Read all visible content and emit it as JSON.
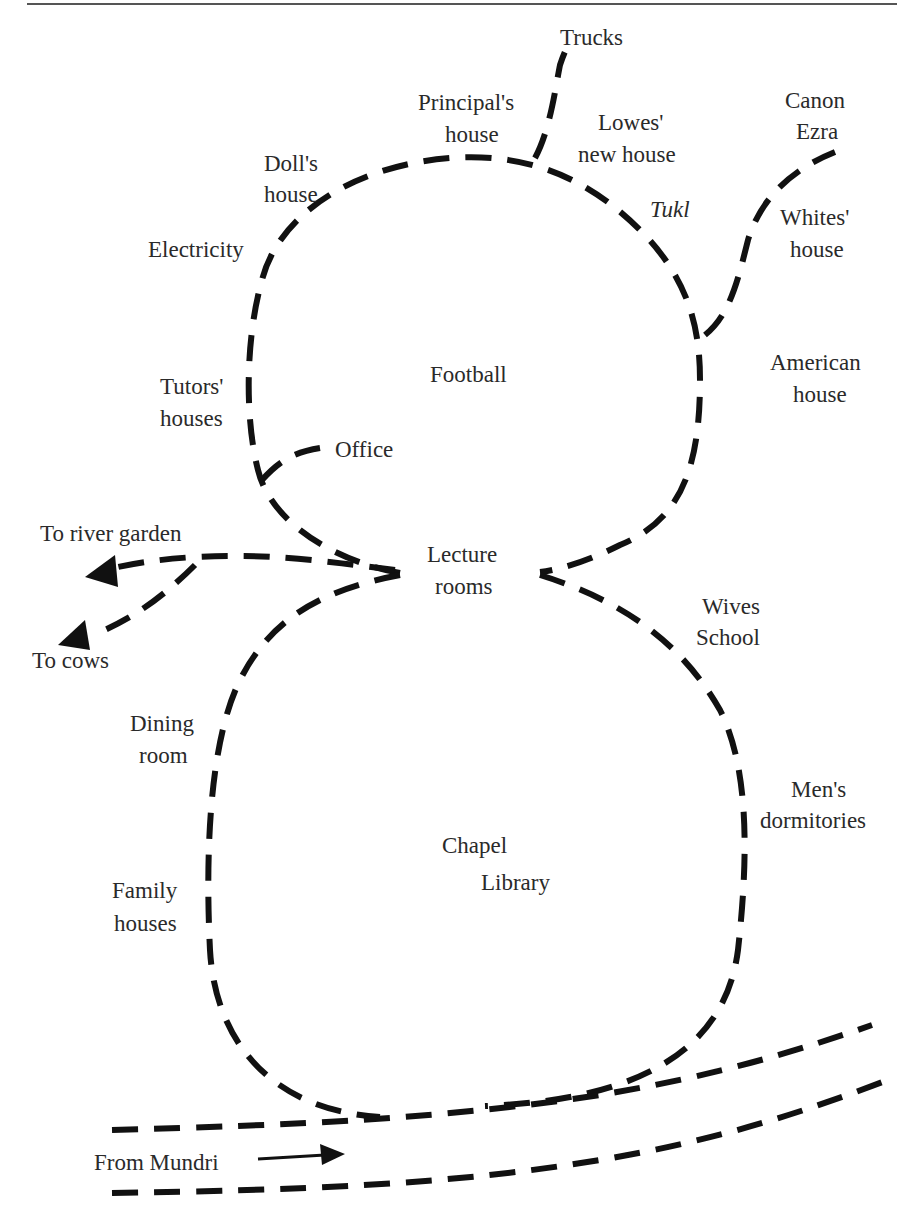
{
  "diagram": {
    "labels": {
      "trucks": "Trucks",
      "principals_house_1": "Principal's",
      "principals_house_2": "house",
      "lowes_1": "Lowes'",
      "lowes_2": "new house",
      "canon_1": "Canon",
      "canon_2": "Ezra",
      "dolls_1": "Doll's",
      "dolls_2": "house",
      "tukl": "Tukl",
      "whites_1": "Whites'",
      "whites_2": "house",
      "electricity": "Electricity",
      "football": "Football",
      "american_1": "American",
      "american_2": "house",
      "tutors_1": "Tutors'",
      "tutors_2": "houses",
      "office": "Office",
      "river_garden": "To river garden",
      "lecture_1": "Lecture",
      "lecture_2": "rooms",
      "wives_1": "Wives",
      "wives_2": "School",
      "cows": "To cows",
      "dining_1": "Dining",
      "dining_2": "room",
      "mens_1": "Men's",
      "mens_2": "dormitories",
      "chapel": "Chapel",
      "library": "Library",
      "family_1": "Family",
      "family_2": "houses",
      "mundri": "From Mundri"
    },
    "colors": {
      "ink": "#111111",
      "text": "#2a2a2a",
      "background": "#ffffff"
    }
  }
}
